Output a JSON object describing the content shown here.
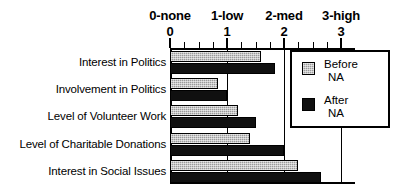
{
  "chart_data": {
    "type": "bar",
    "orientation": "horizontal",
    "title": "",
    "xlabel": "",
    "ylabel": "",
    "xlim": [
      0,
      3
    ],
    "grid": true,
    "legend_position": "right-inside",
    "categories": [
      "Interest in Politics",
      "Involvement in Politics",
      "Level of Volunteer Work",
      "Level of Charitable Donations",
      "Interest in Social Issues"
    ],
    "series": [
      {
        "name": "Before NA",
        "color": "#9a9a9a",
        "values": [
          1.6,
          0.85,
          1.2,
          1.4,
          2.25
        ]
      },
      {
        "name": "After NA",
        "color": "#101010",
        "values": [
          1.85,
          1.0,
          1.5,
          2.0,
          2.65
        ]
      }
    ],
    "xticks": [
      {
        "value": 0,
        "number": "0",
        "label": "0-none"
      },
      {
        "value": 1,
        "number": "1",
        "label": "1-low"
      },
      {
        "value": 2,
        "number": "2",
        "label": "2-med"
      },
      {
        "value": 3,
        "number": "3",
        "label": "3-high"
      }
    ],
    "minor_tick_step": 0.25
  },
  "legend": {
    "entries": [
      {
        "line1": "Before",
        "line2": "NA"
      },
      {
        "line1": "After",
        "line2": "NA"
      }
    ]
  }
}
